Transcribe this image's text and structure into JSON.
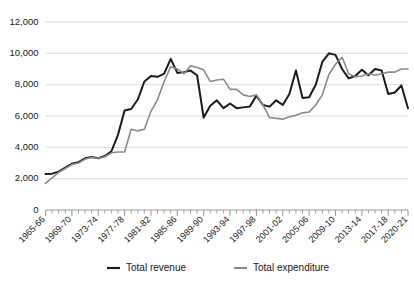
{
  "chart_data": {
    "type": "line",
    "title": "",
    "xlabel": "",
    "ylabel": "",
    "grid": "horizontal",
    "legend_position": "bottom",
    "ylim": [
      0,
      12000
    ],
    "yticks": [
      0,
      2000,
      4000,
      6000,
      8000,
      10000,
      12000
    ],
    "ytick_labels": [
      "0",
      "2,000",
      "4,000",
      "6,000",
      "8,000",
      "10,000",
      "12,000"
    ],
    "x": [
      "1965-66",
      "1966-67",
      "1967-68",
      "1968-69",
      "1969-70",
      "1970-71",
      "1971-72",
      "1972-73",
      "1973-74",
      "1974-75",
      "1975-76",
      "1976-77",
      "1977-78",
      "1978-79",
      "1979-80",
      "1980-81",
      "1981-82",
      "1982-83",
      "1983-84",
      "1984-85",
      "1985-86",
      "1986-87",
      "1987-88",
      "1988-89",
      "1989-90",
      "1990-91",
      "1991-92",
      "1992-93",
      "1993-94",
      "1994-95",
      "1995-96",
      "1996-97",
      "1997-98",
      "1998-99",
      "1999-00",
      "2000-01",
      "2001-02",
      "2002-03",
      "2003-04",
      "2004-05",
      "2005-06",
      "2006-07",
      "2007-08",
      "2008-09",
      "2009-10",
      "2010-11",
      "2011-12",
      "2012-13",
      "2013-14",
      "2014-15",
      "2015-16",
      "2016-17",
      "2017-18",
      "2018-19",
      "2019-20",
      "2020-21"
    ],
    "xtick_labels": [
      "1965-66",
      "1969-70",
      "1973-74",
      "1977-78",
      "1981-82",
      "1985-86",
      "1989-90",
      "1993-94",
      "1997-98",
      "2001-02",
      "2005-06",
      "2009-10",
      "2013-14",
      "2017-18",
      "2020-21"
    ],
    "xtick_indices": [
      0,
      4,
      8,
      12,
      16,
      20,
      24,
      28,
      32,
      36,
      40,
      44,
      48,
      52,
      55
    ],
    "series": [
      {
        "name": "Total revenue",
        "color": "#1a1a1a",
        "width": 2.0,
        "values": [
          2300,
          2320,
          2450,
          2700,
          2950,
          3050,
          3300,
          3380,
          3300,
          3450,
          3750,
          4800,
          6350,
          6450,
          7050,
          8200,
          8550,
          8500,
          8700,
          9650,
          8750,
          8800,
          8900,
          8600,
          5900,
          6650,
          7000,
          6500,
          6800,
          6500,
          6550,
          6600,
          7300,
          6700,
          6600,
          7000,
          6700,
          7400,
          8900,
          7150,
          7200,
          8000,
          9450,
          10000,
          9900,
          9000,
          8400,
          8550,
          8950,
          8600,
          9000,
          8900,
          7400,
          7500,
          7950,
          6500
        ]
      },
      {
        "name": "Total expenditure",
        "color": "#8a8a8a",
        "width": 1.6,
        "values": [
          1700,
          2050,
          2400,
          2650,
          2900,
          3000,
          3250,
          3350,
          3300,
          3400,
          3650,
          3700,
          3700,
          5150,
          5050,
          5150,
          6300,
          7050,
          8200,
          9150,
          9000,
          8700,
          9200,
          9100,
          8950,
          8200,
          8300,
          8350,
          7700,
          7700,
          7350,
          7250,
          7350,
          6700,
          5900,
          5850,
          5800,
          5950,
          6050,
          6200,
          6250,
          6700,
          7350,
          8650,
          9300,
          9750,
          8700,
          8500,
          8550,
          8700,
          8600,
          8700,
          8800,
          8800,
          9000,
          9000
        ]
      }
    ]
  },
  "legend": {
    "items": [
      {
        "label": "Total revenue",
        "color": "#1a1a1a"
      },
      {
        "label": "Total expenditure",
        "color": "#8a8a8a"
      }
    ]
  }
}
